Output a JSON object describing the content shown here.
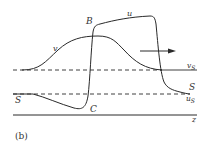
{
  "panel_label": "(b)",
  "labels": {
    "B": "B",
    "u": "u",
    "v": "v",
    "v_s": "v",
    "v_s_sub": "S",
    "S_right": "S",
    "u_s": "u",
    "u_s_sub": "S",
    "S_left": "S",
    "C": "C",
    "z": "z"
  },
  "colors": {
    "stroke": "#2a2a2a",
    "text": "#333333"
  }
}
